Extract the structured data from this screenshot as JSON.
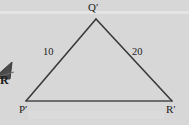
{
  "figure": {
    "name": "triangle-pqr-prime",
    "background_color": "#d7d7d7",
    "stroke_color": "#3a3a3a",
    "text_color": "#1c1c1c",
    "vertices": [
      {
        "id": "q",
        "label": "Q′",
        "x": 96,
        "y": 19
      },
      {
        "id": "p",
        "label": "P′",
        "x": 26,
        "y": 101
      },
      {
        "id": "r",
        "label": "R′",
        "x": 172,
        "y": 101
      }
    ],
    "sides": [
      {
        "id": "pq",
        "label": "10",
        "from": "p",
        "to": "q"
      },
      {
        "id": "qr",
        "label": "20",
        "from": "q",
        "to": "r"
      },
      {
        "id": "pr",
        "label": "",
        "from": "p",
        "to": "r"
      }
    ],
    "fragment": {
      "label": "R",
      "description": "clipped-neighbor-figure"
    }
  }
}
